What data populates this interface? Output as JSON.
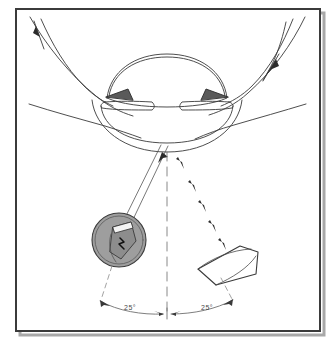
{
  "figure": {
    "background_color": "#ffffff",
    "frame": {
      "border_color": "#3b3b3b",
      "shadow_color": "#9a9a9a",
      "x": 16,
      "y": 9,
      "width": 304,
      "height": 322
    },
    "line_color": "#3a3a3a",
    "dash_color": "#7a7a7a"
  },
  "eye": {
    "name": "anterior-segment-cross-section",
    "parts": [
      {
        "name": "cornea",
        "label": "cornea"
      },
      {
        "name": "anterior-chamber",
        "label": "anterior chamber"
      },
      {
        "name": "iris",
        "label": "iris"
      },
      {
        "name": "crystalline-lens",
        "label": "crystalline lens"
      },
      {
        "name": "limbus-angle-left",
        "label": "iridocorneal angle"
      },
      {
        "name": "limbus-angle-right",
        "label": "iridocorneal angle"
      },
      {
        "name": "eyelid-upper-left",
        "label": "upper eyelid margin"
      },
      {
        "name": "eyelid-upper-right",
        "label": "upper eyelid margin"
      }
    ]
  },
  "illumination": {
    "source_name": "illumination-source",
    "source_fill": "#9e9e9e",
    "source_stroke": "#3a3a3a",
    "beam_name": "illumination-beam",
    "angle_deg": 25,
    "side": "left"
  },
  "observation": {
    "device_name": "observation-lens",
    "device_fill": "#ffffff",
    "device_stroke": "#3a3a3a",
    "path_name": "observation-path",
    "angle_deg": 25,
    "side": "right"
  },
  "axis": {
    "name": "optical-axis",
    "style": "dashed-vertical"
  },
  "labels": {
    "left_angle": "25°",
    "right_angle": "25°"
  },
  "arc": {
    "name": "angle-measurement-arc",
    "center_x": 167,
    "center_y": 140,
    "radius": 172
  },
  "arrows": {
    "top_left_name": "incoming-ray-arrow-left",
    "top_right_name": "incoming-ray-arrow-right",
    "beam_arrow_name": "beam-direction-arrow",
    "observation_arrow_name": "observation-direction-arrow"
  }
}
